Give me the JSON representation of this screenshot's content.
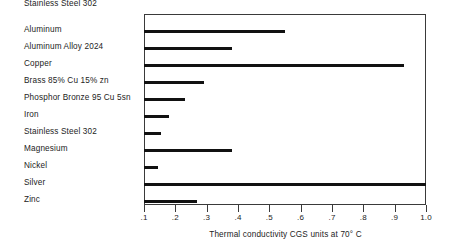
{
  "chart_data": {
    "type": "bar",
    "orientation": "horizontal",
    "title": "",
    "xlabel": "Thermal conductivity CGS units at 70° C",
    "ylabel": "",
    "xlim": [
      0.1,
      1.0
    ],
    "grid": false,
    "legend": null,
    "axis_tick_labels": [
      ".1",
      ".2",
      ".3",
      ".4",
      ".5",
      ".6",
      ".7",
      ".8",
      ".9",
      "1.0"
    ],
    "axis_tick_values": [
      0.1,
      0.2,
      0.3,
      0.4,
      0.5,
      0.6,
      0.7,
      0.8,
      0.9,
      1.0
    ],
    "categories": [
      "Aluminum",
      "Aluminum Alloy 2024",
      "Copper",
      "Brass 85% Cu    15% zn",
      "Phosphor Bronze 95 Cu 5sn",
      "Iron",
      "Stainless Steel 302",
      "Magnesium",
      "Nickel",
      "Silver",
      "Zinc"
    ],
    "values": [
      0.55,
      0.38,
      0.93,
      0.29,
      0.23,
      0.18,
      0.155,
      0.38,
      0.145,
      1.0,
      0.27
    ],
    "bar_color": "#111111",
    "background_color": "#ffffff",
    "axis_color": "#3a3a3a"
  },
  "caption": {
    "text": "Thermal conductivity CGS units at 70° C"
  }
}
